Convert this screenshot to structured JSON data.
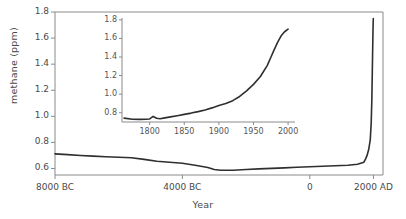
{
  "chart_data": {
    "type": "line",
    "title": "",
    "xlabel": "Year",
    "ylabel": "methane (ppm)",
    "xlim": [
      -8000,
      2300
    ],
    "ylim": [
      0.55,
      1.8
    ],
    "grid": false,
    "legend": "none",
    "x_tick_labels": [
      "8000 BC",
      "4000 BC",
      "0",
      "2000 AD"
    ],
    "x_tick_values": [
      -8000,
      -4000,
      0,
      2000
    ],
    "y_tick_labels": [
      "0.6",
      "0.8",
      "1.0",
      "1.2",
      "1.4",
      "1.6",
      "1.8"
    ],
    "y_tick_values": [
      0.6,
      0.8,
      1.0,
      1.2,
      1.4,
      1.6,
      1.8
    ],
    "series": [
      {
        "name": "methane",
        "x": [
          -8000,
          -7600,
          -7200,
          -6800,
          -6400,
          -6000,
          -5600,
          -5200,
          -4800,
          -4400,
          -4000,
          -3600,
          -3200,
          -3000,
          -2800,
          -2400,
          -2000,
          -1600,
          -1200,
          -800,
          -400,
          0,
          400,
          800,
          1200,
          1500,
          1700,
          1750,
          1800,
          1850,
          1900,
          1930,
          1950,
          1970,
          1985,
          1995
        ],
        "y": [
          0.712,
          0.706,
          0.7,
          0.695,
          0.69,
          0.686,
          0.682,
          0.67,
          0.655,
          0.648,
          0.64,
          0.625,
          0.608,
          0.592,
          0.586,
          0.587,
          0.592,
          0.597,
          0.601,
          0.605,
          0.609,
          0.613,
          0.617,
          0.621,
          0.625,
          0.632,
          0.648,
          0.672,
          0.7,
          0.745,
          0.82,
          0.95,
          1.13,
          1.43,
          1.65,
          1.75
        ]
      }
    ],
    "inset": {
      "type": "line",
      "xlim": [
        1760,
        2010
      ],
      "ylim": [
        0.7,
        1.82
      ],
      "x_tick_labels": [
        "1800",
        "1850",
        "1900",
        "1950",
        "2000"
      ],
      "x_tick_values": [
        1800,
        1850,
        1900,
        1950,
        2000
      ],
      "y_tick_labels": [
        "0.8",
        "1.0",
        "1.2",
        "1.4",
        "1.6",
        "1.8"
      ],
      "y_tick_values": [
        0.8,
        1.0,
        1.2,
        1.4,
        1.6,
        1.8
      ],
      "series": [
        {
          "name": "methane",
          "x": [
            1763,
            1775,
            1785,
            1795,
            1800,
            1805,
            1810,
            1815,
            1820,
            1830,
            1840,
            1850,
            1860,
            1870,
            1880,
            1890,
            1900,
            1910,
            1920,
            1930,
            1940,
            1950,
            1960,
            1970,
            1975,
            1980,
            1985,
            1990,
            1995,
            2000
          ],
          "y": [
            0.742,
            0.73,
            0.728,
            0.73,
            0.733,
            0.76,
            0.74,
            0.735,
            0.742,
            0.755,
            0.768,
            0.782,
            0.796,
            0.812,
            0.83,
            0.852,
            0.878,
            0.9,
            0.93,
            0.975,
            1.035,
            1.105,
            1.19,
            1.31,
            1.395,
            1.48,
            1.56,
            1.628,
            1.672,
            1.7
          ]
        }
      ]
    }
  },
  "colors": {
    "line": "#2f2f2f",
    "axis": "#8a8a8a",
    "text": "#4a4a4a",
    "background": "#ffffff"
  }
}
